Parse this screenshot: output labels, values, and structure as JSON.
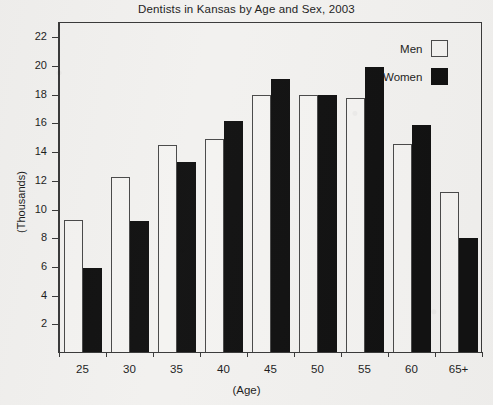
{
  "chart_data": {
    "type": "bar",
    "title": "Dentists in Kansas by Age and Sex, 2003",
    "xlabel": "(Age)",
    "ylabel": "(Thousands)",
    "categories": [
      "25",
      "30",
      "35",
      "40",
      "45",
      "50",
      "55",
      "60",
      "65+"
    ],
    "series": [
      {
        "name": "Men",
        "color": "#f4f3f1",
        "values": [
          9.3,
          12.3,
          14.5,
          14.9,
          18.0,
          18.0,
          17.8,
          14.6,
          11.2
        ]
      },
      {
        "name": "Women",
        "color": "#121212",
        "values": [
          5.9,
          9.2,
          13.3,
          16.2,
          19.1,
          18.0,
          19.9,
          15.9,
          8.0
        ]
      }
    ],
    "ylim": [
      0,
      23
    ],
    "yticks": [
      2,
      4,
      6,
      8,
      10,
      12,
      14,
      16,
      18,
      20,
      22
    ],
    "grid": false,
    "legend_position": "top-right",
    "frame": true
  },
  "legend": {
    "entries": [
      {
        "label": "Men",
        "swatch": "hollow-square"
      },
      {
        "label": "Women",
        "swatch": "filled-square"
      }
    ]
  }
}
